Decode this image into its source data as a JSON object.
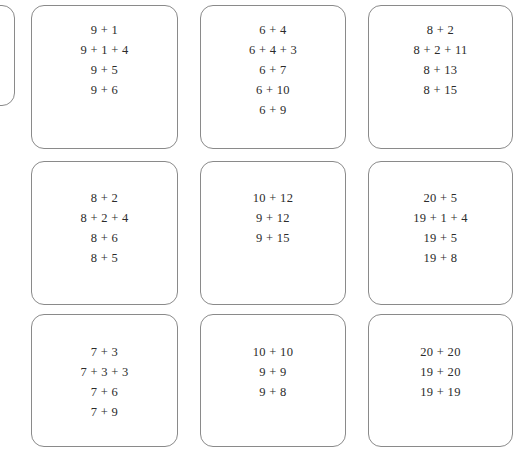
{
  "worksheet": {
    "title": "Addition expression cards",
    "card_border_color": "#8a8a8a",
    "text_color": "#2b2b2b",
    "background_color": "#ffffff",
    "columns": 3,
    "rows": 3,
    "partial_card": {
      "label": "clipped-empty-card",
      "lines": []
    },
    "cards": [
      {
        "position": "row1-col1",
        "lines": [
          "9 + 1",
          "9 + 1 + 4",
          "9 + 5",
          "9 + 6"
        ]
      },
      {
        "position": "row1-col2",
        "lines": [
          "6 + 4",
          "6 + 4 + 3",
          "6 + 7",
          "6 + 10",
          "6 + 9"
        ]
      },
      {
        "position": "row1-col3",
        "lines": [
          "8 + 2",
          "8 + 2 + 11",
          "8 + 13",
          "8 + 15"
        ]
      },
      {
        "position": "row2-col1",
        "lines": [
          "8 + 2",
          "8 + 2 + 4",
          "8 + 6",
          "8 + 5"
        ]
      },
      {
        "position": "row2-col2",
        "lines": [
          "10 + 12",
          "9 + 12",
          "9 + 15"
        ]
      },
      {
        "position": "row2-col3",
        "lines": [
          "20 + 5",
          "19 + 1 + 4",
          "19 + 5",
          "19 + 8"
        ]
      },
      {
        "position": "row3-col1",
        "lines": [
          "7 + 3",
          "7 + 3 + 3",
          "7 + 6",
          "7 + 9"
        ]
      },
      {
        "position": "row3-col2",
        "lines": [
          "10 + 10",
          "9 + 9",
          "9 + 8"
        ]
      },
      {
        "position": "row3-col3",
        "lines": [
          "20 + 20",
          "19 + 20",
          "19 + 19"
        ]
      }
    ]
  }
}
